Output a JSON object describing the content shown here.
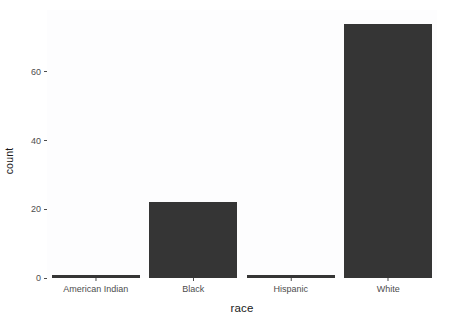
{
  "chart_data": {
    "type": "bar",
    "title": "",
    "subtitle": "",
    "xlabel": "race",
    "ylabel": "count",
    "categories": [
      "American Indian",
      "Black",
      "Hispanic",
      "White"
    ],
    "values": [
      1,
      22,
      1,
      74
    ],
    "ylim": [
      0,
      78
    ],
    "yticks": [
      0,
      20,
      40,
      60
    ],
    "ytick_labels": [
      "0",
      "20",
      "40",
      "60"
    ],
    "grid": false,
    "legend": "none",
    "bar_color": "#353535",
    "panel_background": "#fdfdfe",
    "axis_text_color": "#4d4d4d",
    "axis_title_color": "#1a1a1a"
  }
}
